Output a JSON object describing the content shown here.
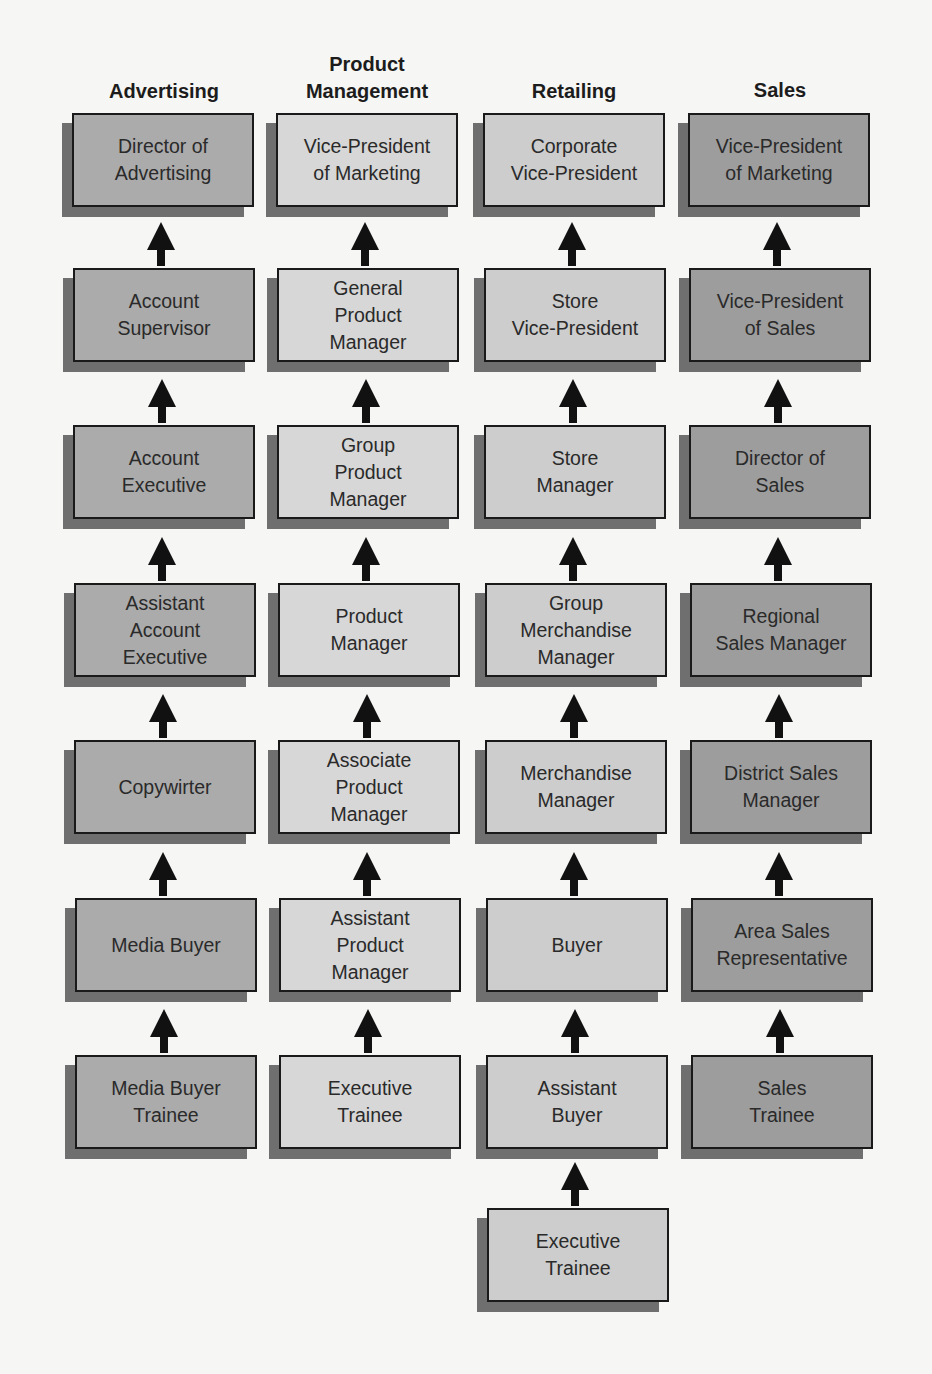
{
  "diagram": {
    "type": "career-ladder",
    "colors": {
      "background": "#f6f6f4",
      "advertising_box": "#ababab",
      "product_management_box": "#d7d7d7",
      "retailing_box": "#cdcdcd",
      "sales_box": "#9d9d9d",
      "shadow": "#6f6f6f",
      "border": "#1a1a1a",
      "arrow": "#111111"
    },
    "columns": [
      {
        "header": "Advertising",
        "levels": [
          "Director of\nAdvertising",
          "Account\nSupervisor",
          "Account\nExecutive",
          "Assistant\nAccount\nExecutive",
          "Copywirter",
          "Media Buyer",
          "Media Buyer\nTrainee"
        ]
      },
      {
        "header": "Product\nManagement",
        "levels": [
          "Vice-President\nof Marketing",
          "General\nProduct\nManager",
          "Group\nProduct\nManager",
          "Product\nManager",
          "Associate\nProduct\nManager",
          "Assistant\nProduct\nManager",
          "Executive\nTrainee"
        ]
      },
      {
        "header": "Retailing",
        "levels": [
          "Corporate\nVice-President",
          "Store\nVice-President",
          "Store\nManager",
          "Group\nMerchandise\nManager",
          "Merchandise\nManager",
          "Buyer",
          "Assistant\nBuyer",
          "Executive\nTrainee"
        ]
      },
      {
        "header": "Sales",
        "levels": [
          "Vice-President\nof Marketing",
          "Vice-President\nof Sales",
          "Director of\nSales",
          "Regional\nSales Manager",
          "District Sales\nManager",
          "Area Sales\nRepresentative",
          "Sales\nTrainee"
        ]
      }
    ]
  }
}
